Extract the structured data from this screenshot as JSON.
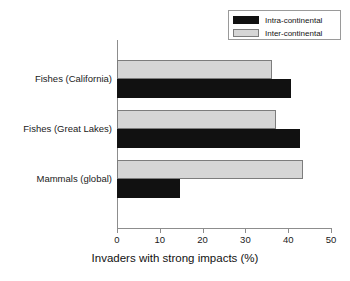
{
  "chart_data": {
    "type": "bar",
    "orientation": "horizontal",
    "title": "",
    "subtitle": "",
    "xlabel": "Invaders with strong impacts (%)",
    "ylabel": "",
    "categories": [
      "Fishes (California)",
      "Fishes (Great Lakes)",
      "Mammals (global)"
    ],
    "series": [
      {
        "name": "Intra-continental",
        "color": "#111111",
        "values": [
          40.7,
          42.8,
          14.7
        ]
      },
      {
        "name": "Inter-continental",
        "color": "#d6d6d6",
        "values": [
          36.2,
          37.2,
          43.5
        ]
      }
    ],
    "xlim": [
      0,
      50
    ],
    "xticks": [
      0,
      10,
      20,
      30,
      40,
      50
    ],
    "xtick_labels": [
      "0",
      "10",
      "20",
      "30",
      "40",
      "50"
    ],
    "grid": false,
    "legend_position": "top-right",
    "legend_entries": [
      "Intra-continental",
      "Inter-continental"
    ]
  },
  "legend": {
    "items": [
      {
        "label": "Intra-continental",
        "swatch": "#111111"
      },
      {
        "label": "Inter-continental",
        "swatch": "#d6d6d6"
      }
    ]
  },
  "axis": {
    "x_title": "Invaders with strong impacts (%)",
    "x_tick_labels": [
      "0",
      "10",
      "20",
      "30",
      "40",
      "50"
    ],
    "y_category_labels": [
      "Fishes (California)",
      "Fishes (Great Lakes)",
      "Mammals (global)"
    ]
  }
}
